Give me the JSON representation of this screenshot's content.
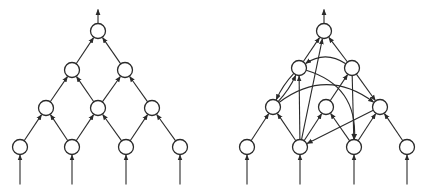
{
  "figure": {
    "panels": [
      {
        "name": "layered-network",
        "nodes": [
          {
            "id": "L_top",
            "x": 98,
            "y": 31
          },
          {
            "id": "L_r2_1",
            "x": 72,
            "y": 70
          },
          {
            "id": "L_r2_2",
            "x": 125,
            "y": 70
          },
          {
            "id": "L_r3_1",
            "x": 46,
            "y": 108
          },
          {
            "id": "L_r3_2",
            "x": 98,
            "y": 108
          },
          {
            "id": "L_r3_3",
            "x": 152,
            "y": 108
          },
          {
            "id": "L_r4_1",
            "x": 20,
            "y": 147
          },
          {
            "id": "L_r4_2",
            "x": 72,
            "y": 147
          },
          {
            "id": "L_r4_3",
            "x": 126,
            "y": 147
          },
          {
            "id": "L_r4_4",
            "x": 180,
            "y": 147
          }
        ],
        "edges": [
          {
            "from": "L_r4_1",
            "to": "L_r3_1"
          },
          {
            "from": "L_r4_2",
            "to": "L_r3_1"
          },
          {
            "from": "L_r4_2",
            "to": "L_r3_2"
          },
          {
            "from": "L_r4_3",
            "to": "L_r3_2"
          },
          {
            "from": "L_r4_3",
            "to": "L_r3_3"
          },
          {
            "from": "L_r4_4",
            "to": "L_r3_3"
          },
          {
            "from": "L_r3_1",
            "to": "L_r2_1"
          },
          {
            "from": "L_r3_2",
            "to": "L_r2_1"
          },
          {
            "from": "L_r3_2",
            "to": "L_r2_2"
          },
          {
            "from": "L_r3_3",
            "to": "L_r2_2"
          },
          {
            "from": "L_r2_1",
            "to": "L_top"
          },
          {
            "from": "L_r2_2",
            "to": "L_top"
          }
        ],
        "inputs": [
          "L_r4_1",
          "L_r4_2",
          "L_r4_3",
          "L_r4_4"
        ],
        "output": "L_top"
      },
      {
        "name": "recurrent-network",
        "nodes": [
          {
            "id": "R_top",
            "x": 324,
            "y": 31
          },
          {
            "id": "R_r2_1",
            "x": 299,
            "y": 68
          },
          {
            "id": "R_r2_2",
            "x": 352,
            "y": 68
          },
          {
            "id": "R_r3_1",
            "x": 273,
            "y": 107
          },
          {
            "id": "R_r3_2",
            "x": 326,
            "y": 107
          },
          {
            "id": "R_r3_3",
            "x": 380,
            "y": 107
          },
          {
            "id": "R_r4_1",
            "x": 247,
            "y": 147
          },
          {
            "id": "R_r4_2",
            "x": 300,
            "y": 147
          },
          {
            "id": "R_r4_3",
            "x": 354,
            "y": 147
          },
          {
            "id": "R_r4_4",
            "x": 407,
            "y": 147
          }
        ],
        "edges": [
          {
            "from": "R_r4_1",
            "to": "R_r3_1"
          },
          {
            "from": "R_r4_2",
            "to": "R_r3_1"
          },
          {
            "from": "R_r4_2",
            "to": "R_r2_1"
          },
          {
            "from": "R_r4_2",
            "to": "R_top"
          },
          {
            "from": "R_r4_2",
            "to": "R_r3_2"
          },
          {
            "from": "R_r4_3",
            "to": "R_r3_2"
          },
          {
            "from": "R_r4_3",
            "to": "R_r3_3"
          },
          {
            "from": "R_r4_4",
            "to": "R_r3_3"
          },
          {
            "from": "R_r3_3",
            "to": "R_r4_2"
          },
          {
            "from": "R_r2_2",
            "to": "R_r4_3"
          },
          {
            "from": "R_r3_2",
            "to": "R_r2_2"
          },
          {
            "from": "R_r2_2",
            "to": "R_r3_3"
          },
          {
            "from": "R_r3_1",
            "to": "R_r2_1",
            "curve": 4
          },
          {
            "from": "R_r2_1",
            "to": "R_r3_1",
            "curve": 4
          },
          {
            "from": "R_r3_1",
            "to": "R_r3_3",
            "curve": -40
          },
          {
            "from": "R_r2_1",
            "to": "R_r4_3",
            "curve": -38
          },
          {
            "from": "R_r2_2",
            "to": "R_r2_1",
            "curve": 18
          },
          {
            "from": "R_r2_1",
            "to": "R_top"
          },
          {
            "from": "R_r2_2",
            "to": "R_top"
          }
        ],
        "inputs": [
          "R_r4_1",
          "R_r4_2",
          "R_r4_3",
          "R_r4_4"
        ],
        "output": "R_top"
      }
    ],
    "style": {
      "stroke": "#2a2a2a",
      "fill": "#ffffff",
      "node_radius": 7.5,
      "input_line_length": 30,
      "output_line_length": 14
    }
  }
}
